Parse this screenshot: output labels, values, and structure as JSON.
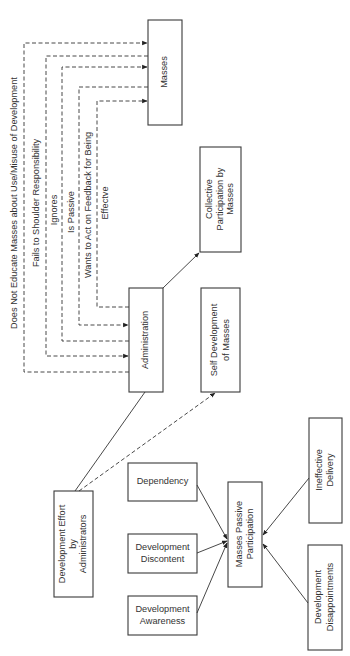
{
  "diagram": {
    "nodes": {
      "masses": "Masses",
      "collective": [
        "Collective",
        "Participation by",
        "Masses"
      ],
      "administration": "Administration",
      "self_development": [
        "Self Development",
        "of Masses"
      ],
      "development_effort": [
        "Development Effort",
        "by",
        "Administrators"
      ],
      "dependency": "Dependency",
      "development_discontent": [
        "Development",
        "Discontent"
      ],
      "development_awareness": [
        "Development",
        "Awareness"
      ],
      "masses_passive": [
        "Masses Passive",
        "Participation"
      ],
      "ineffective_delivery": [
        "Ineffective",
        "Delivery"
      ],
      "development_disappointments": [
        "Development",
        "Disappointments"
      ]
    },
    "edge_labels": {
      "does_not_educate": "Does Not Educate Masses about Use/Misuse of Development",
      "fails_to_shoulder": "Fails to Shoulder Responsibility",
      "ignores": "Ignores",
      "is_passive": "Is Passive",
      "wants_to_act_1": "Wants to Act on Feedback for Being",
      "wants_to_act_2": "Effectve"
    },
    "colors": {
      "line": "#333333",
      "box_border": "#3a3a3a",
      "background": "#ffffff"
    }
  }
}
